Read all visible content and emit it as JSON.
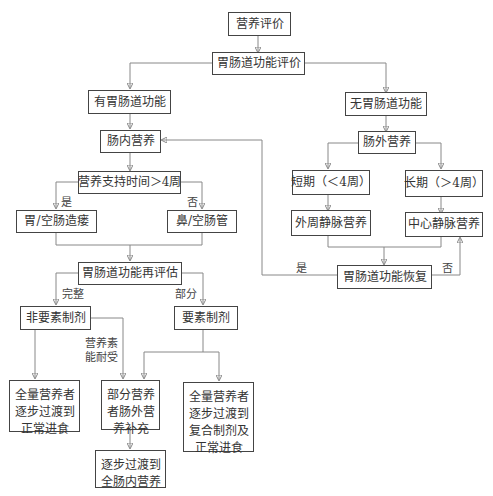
{
  "diagram": {
    "type": "flowchart",
    "nodes": {
      "nutrition_assessment": "营养评价",
      "gi_function_assessment": "胃肠道功能评价",
      "has_gi_function": "有胃肠道功能",
      "no_gi_function": "无胃肠道功能",
      "enteral_nutrition": "肠内营养",
      "parenteral_nutrition": "肠外营养",
      "support_duration_over_4w": "营养支持时间＞4周",
      "short_term": "短期（＜4周）",
      "long_term": "长期（＞4周）",
      "gastrostomy": "胃/空肠造瘘",
      "nasal_tube": "鼻/空肠管",
      "peripheral_iv": "外周静脉营养",
      "central_iv": "中心静脉营养",
      "gi_reassessment": "胃肠道功能再评估",
      "gi_recovery": "胃肠道功能恢复",
      "non_elemental": "非要素制剂",
      "elemental": "要素制剂",
      "full_to_normal_diet": "全量营养者逐步过渡到正常进食",
      "partial_parenteral_supplement": "部分营养者肠外营养补充",
      "full_to_compound_and_normal": "全量营养者逐步过渡到复合制剂及正常进食",
      "transition_full_enteral": "逐步过渡到全肠内营养"
    },
    "edge_labels": {
      "yes_left": "是",
      "no_left": "否",
      "yes_recovery": "是",
      "no_recovery": "否",
      "complete": "完整",
      "partial": "部分",
      "nutrient_tolerance": "营养素能耐受"
    }
  }
}
